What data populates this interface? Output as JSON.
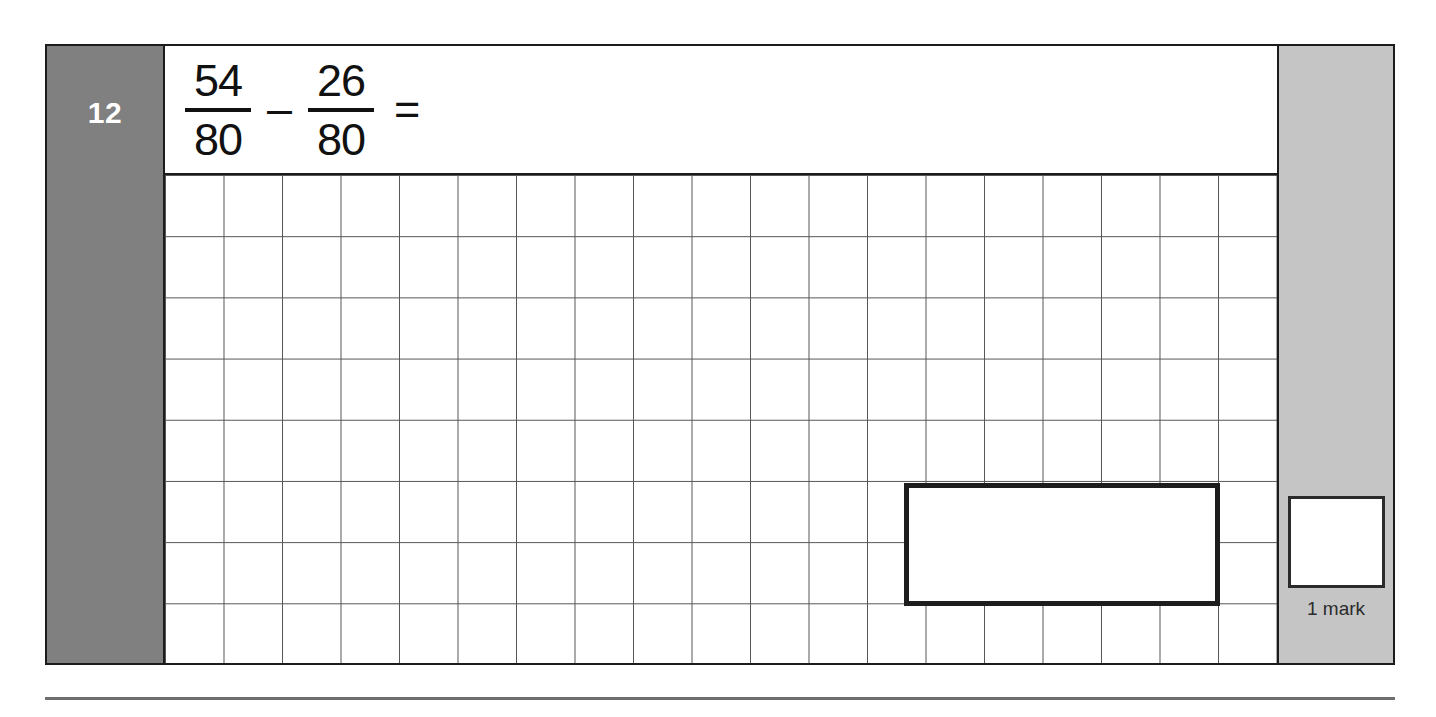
{
  "question": {
    "number": "12",
    "expression": {
      "first_fraction": {
        "numerator": "54",
        "denominator": "80"
      },
      "operator": "–",
      "second_fraction": {
        "numerator": "26",
        "denominator": "80"
      },
      "equals": "="
    },
    "answer_box_value": ""
  },
  "marks": {
    "box_value": "",
    "label": "1 mark"
  },
  "grid": {
    "columns": 19,
    "rows": 8
  },
  "colors": {
    "number_column_bg": "#808080",
    "mark_column_bg": "#c5c5c5",
    "frame_border": "#1c1c1c",
    "grid_line": "#555555",
    "answer_box_border": "#1d1d1d",
    "page_bg": "#ffffff",
    "footer_rule": "#6e6e6e"
  }
}
